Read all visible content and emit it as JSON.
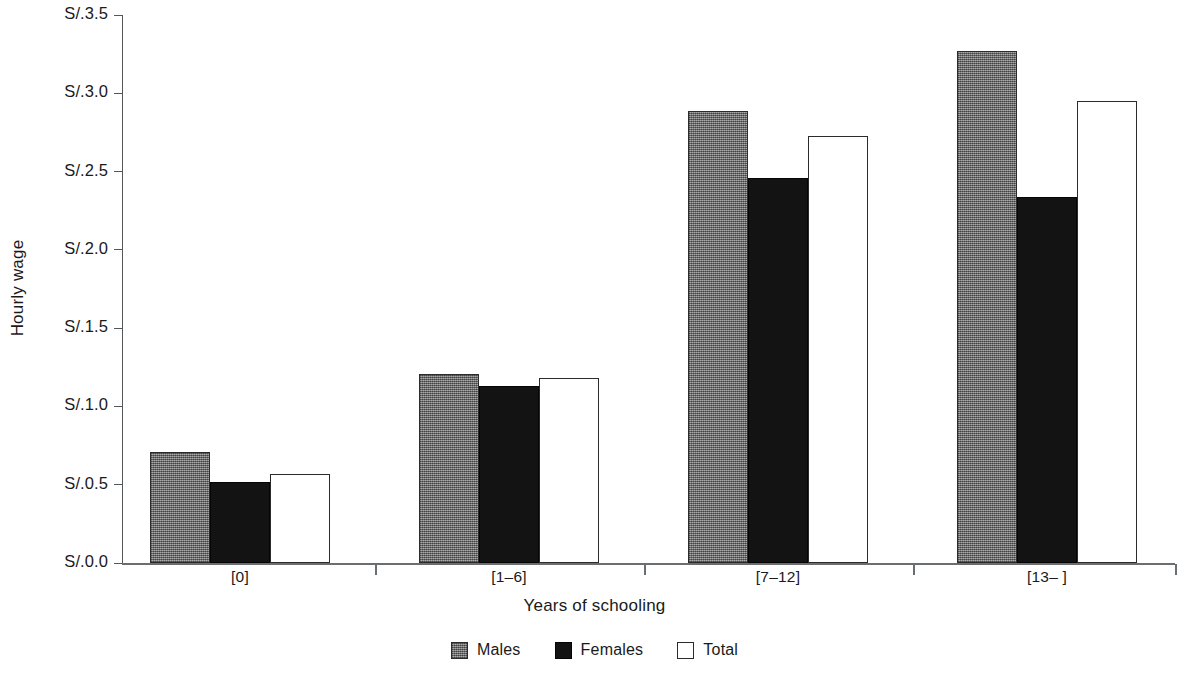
{
  "chart_data": {
    "type": "bar",
    "title": "",
    "xlabel": "Years of schooling",
    "ylabel": "Hourly wage",
    "categories": [
      "[0]",
      "[1–6]",
      "[7–12]",
      "[13– ]"
    ],
    "series": [
      {
        "name": "Males",
        "values": [
          0.71,
          1.21,
          2.89,
          3.27
        ],
        "color": "#7c7c7c"
      },
      {
        "name": "Females",
        "values": [
          0.52,
          1.13,
          2.46,
          2.34
        ],
        "color": "#131313"
      },
      {
        "name": "Total",
        "values": [
          0.57,
          1.18,
          2.73,
          2.95
        ],
        "color": "#ffffff"
      }
    ],
    "ylim": [
      0.0,
      3.5
    ],
    "ytick_values": [
      0.0,
      0.5,
      1.0,
      1.5,
      2.0,
      2.5,
      3.0,
      3.5
    ],
    "ytick_labels": [
      "S/.0.0",
      "S/.0.5",
      "S/.1.0",
      "S/.1.5",
      "S/.2.0",
      "S/.2.5",
      "S/.3.0",
      "S/.3.5"
    ],
    "y_tick_prefix": "S/.",
    "grid": false,
    "legend_position": "bottom-center",
    "legend_entries": [
      "Males",
      "Females",
      "Total"
    ]
  },
  "axes": {
    "y_title": "Hourly wage",
    "x_title": "Years of schooling"
  }
}
